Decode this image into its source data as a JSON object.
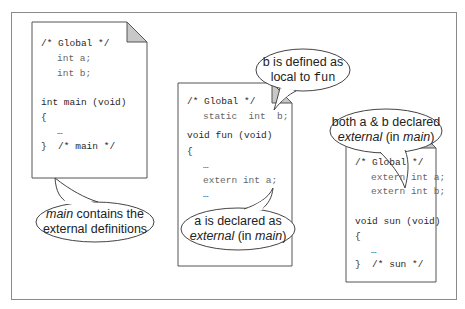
{
  "diagram": {
    "title": "",
    "colors": {
      "border": "#8a8a8a",
      "page_border": "#555555",
      "fold": "#c8c8c8",
      "text": "#222222",
      "code_dim": "#666666"
    },
    "pages": [
      {
        "id": "main-file",
        "lines": [
          {
            "text": "/* Global */",
            "indent": 0
          },
          {
            "text": "int a;",
            "indent": 1
          },
          {
            "text": "int b;",
            "indent": 1
          },
          {
            "text": "",
            "indent": 0
          },
          {
            "text": "int main (void)",
            "indent": 0
          },
          {
            "text": "{",
            "indent": 0
          },
          {
            "text": "…",
            "indent": 1
          },
          {
            "text": "}  /* main */",
            "indent": 0
          }
        ]
      },
      {
        "id": "fun-file",
        "lines": [
          {
            "text": "/* Global */",
            "indent": 0
          },
          {
            "text": "static  int  b;",
            "indent": 1
          },
          {
            "text": "void fun (void)",
            "indent": 0
          },
          {
            "text": "{",
            "indent": 0
          },
          {
            "text": "…",
            "indent": 1
          },
          {
            "text": "extern int a;",
            "indent": 1
          },
          {
            "text": "…",
            "indent": 1
          },
          {
            "text": "}",
            "indent": 0
          }
        ]
      },
      {
        "id": "sun-file",
        "lines": [
          {
            "text": "/* Global */",
            "indent": 0
          },
          {
            "text": "extern int a;",
            "indent": 1
          },
          {
            "text": "extern int b;",
            "indent": 1
          },
          {
            "text": "",
            "indent": 0
          },
          {
            "text": "void sun (void)",
            "indent": 0
          },
          {
            "text": "{",
            "indent": 0
          },
          {
            "text": "…",
            "indent": 1
          },
          {
            "text": "}  /* sun */",
            "indent": 0
          }
        ]
      }
    ],
    "callouts": {
      "main": {
        "line1_italic": "main",
        "line1_rest": " contains the",
        "line2": "external definitions"
      },
      "fun_a": {
        "line1": "a is declared as",
        "line2_italic": "external",
        "line2_mid": " (in ",
        "line2_italic2": "main",
        "line2_end": ")"
      },
      "fun_b": {
        "line1": "b is defined as",
        "line2_prefix": "local to ",
        "line2_mono": "fun"
      },
      "sun": {
        "line1": "both a & b declared",
        "line2_italic": "external",
        "line2_mid": " (in ",
        "line2_italic2": "main",
        "line2_end": ")"
      }
    }
  }
}
